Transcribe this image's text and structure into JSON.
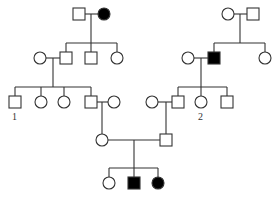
{
  "diagram": {
    "type": "pedigree-chart",
    "colors": {
      "affected": "#000000",
      "unaffected": "#ffffff",
      "line": "#333333"
    },
    "individuals": [
      {
        "id": "g1-m-left",
        "sex": "male",
        "affected": false,
        "x": 79,
        "y": 14
      },
      {
        "id": "g1-f-left",
        "sex": "female",
        "affected": true,
        "x": 104,
        "y": 14
      },
      {
        "id": "g1-f-right",
        "sex": "female",
        "affected": false,
        "x": 228,
        "y": 14
      },
      {
        "id": "g1-m-right",
        "sex": "male",
        "affected": false,
        "x": 253,
        "y": 14
      },
      {
        "id": "g2-f-spouse-left",
        "sex": "female",
        "affected": false,
        "x": 40,
        "y": 58
      },
      {
        "id": "g2-m-left-1",
        "sex": "male",
        "affected": false,
        "x": 66,
        "y": 58
      },
      {
        "id": "g2-m-left-2",
        "sex": "male",
        "affected": false,
        "x": 91,
        "y": 58
      },
      {
        "id": "g2-f-left-3",
        "sex": "female",
        "affected": false,
        "x": 117,
        "y": 58
      },
      {
        "id": "g2-f-spouse-right",
        "sex": "female",
        "affected": false,
        "x": 188,
        "y": 58
      },
      {
        "id": "g2-m-right-1",
        "sex": "male",
        "affected": true,
        "x": 214,
        "y": 58
      },
      {
        "id": "g2-f-right-2",
        "sex": "female",
        "affected": false,
        "x": 265,
        "y": 58
      },
      {
        "id": "g3-m-1",
        "sex": "male",
        "affected": false,
        "x": 15,
        "y": 102,
        "label": "1"
      },
      {
        "id": "g3-f-2",
        "sex": "female",
        "affected": false,
        "x": 41,
        "y": 102
      },
      {
        "id": "g3-f-3",
        "sex": "female",
        "affected": false,
        "x": 64,
        "y": 102
      },
      {
        "id": "g3-m-4",
        "sex": "male",
        "affected": false,
        "x": 91,
        "y": 102
      },
      {
        "id": "g3-f-spouse-a",
        "sex": "female",
        "affected": false,
        "x": 114,
        "y": 102
      },
      {
        "id": "g3-f-spouse-b",
        "sex": "female",
        "affected": false,
        "x": 152,
        "y": 102
      },
      {
        "id": "g3-m-5",
        "sex": "male",
        "affected": false,
        "x": 178,
        "y": 102
      },
      {
        "id": "g3-f-6",
        "sex": "female",
        "affected": false,
        "x": 201,
        "y": 102,
        "label": "2"
      },
      {
        "id": "g3-m-7",
        "sex": "male",
        "affected": false,
        "x": 227,
        "y": 102
      },
      {
        "id": "g4-f",
        "sex": "female",
        "affected": false,
        "x": 102,
        "y": 140
      },
      {
        "id": "g4-m",
        "sex": "male",
        "affected": false,
        "x": 166,
        "y": 140
      },
      {
        "id": "g5-f-1",
        "sex": "female",
        "affected": false,
        "x": 109,
        "y": 183
      },
      {
        "id": "g5-m-2",
        "sex": "male",
        "affected": true,
        "x": 134,
        "y": 183
      },
      {
        "id": "g5-f-3",
        "sex": "female",
        "affected": true,
        "x": 158,
        "y": 183
      }
    ],
    "labels": [
      {
        "text": "1",
        "x": 12,
        "y": 113
      },
      {
        "text": "2",
        "x": 198,
        "y": 113
      }
    ]
  }
}
